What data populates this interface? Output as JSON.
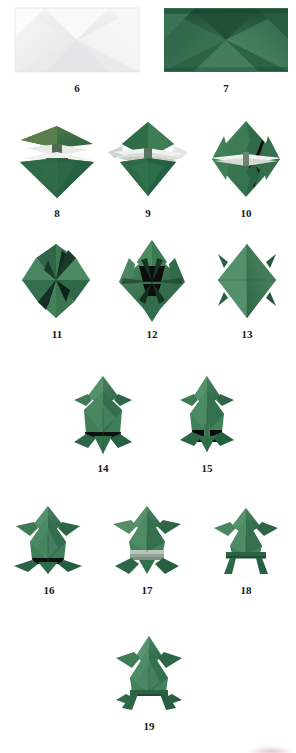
{
  "page": {
    "type": "origami-instruction-photo-sequence",
    "background_color": "#ffffff",
    "paper_colors": {
      "white_side": "#f3f4f4",
      "green_light": "#6ba678",
      "green_mid": "#3f8a5c",
      "green_dark": "#2c6443",
      "green_deep": "#1d4430",
      "shadow_black": "#0b0f0c",
      "highlight_white": "#eef0ec"
    },
    "caption_color": "#181818"
  },
  "steps": [
    {
      "number": "6",
      "name": "step-6-white-side-square-base-preliminary",
      "description": "white side of paper, rectangle with diagonal creases forming X pattern",
      "color": "white",
      "x": 14,
      "y": 6,
      "w": 126,
      "h": 68,
      "caption_x": 57,
      "caption_y": 82
    },
    {
      "number": "7",
      "name": "step-7-green-side-creased-rectangle",
      "description": "green side of paper, rectangle with diagonal creases forming X pattern",
      "color": "green",
      "x": 163,
      "y": 6,
      "w": 126,
      "h": 68,
      "caption_x": 206,
      "caption_y": 82
    },
    {
      "number": "8",
      "name": "step-8-partial-collapse-diamond",
      "description": "diamond shape with upper flaps splayed showing white interior",
      "color": "green",
      "x": 16,
      "y": 118,
      "w": 82,
      "h": 82,
      "caption_x": 37,
      "caption_y": 207
    },
    {
      "number": "9",
      "name": "step-9-collapsed-diamond-side-points",
      "description": "diamond with horizontal white side points extended left and right",
      "color": "green",
      "x": 106,
      "y": 118,
      "w": 84,
      "h": 82,
      "caption_x": 128,
      "caption_y": 207
    },
    {
      "number": "10",
      "name": "step-10-diamond-with-open-flaps",
      "description": "diamond with open vertical flaps revealing dark interior",
      "color": "green",
      "x": 206,
      "y": 118,
      "w": 80,
      "h": 82,
      "caption_x": 226,
      "caption_y": 207
    },
    {
      "number": "11",
      "name": "step-11-pinwheel-diamond",
      "description": "diamond with swirled pinwheel-like folds",
      "color": "green",
      "x": 18,
      "y": 240,
      "w": 76,
      "h": 82,
      "caption_x": 37,
      "caption_y": 328
    },
    {
      "number": "12",
      "name": "step-12-four-point-diamond",
      "description": "diamond with four raised points and dark center opening",
      "color": "green",
      "x": 113,
      "y": 238,
      "w": 78,
      "h": 86,
      "caption_x": 132,
      "caption_y": 328
    },
    {
      "number": "13",
      "name": "step-13-diamond-with-side-spikes",
      "description": "smooth diamond with small spikes at the four sides",
      "color": "green",
      "x": 214,
      "y": 240,
      "w": 66,
      "h": 82,
      "caption_x": 227,
      "caption_y": 328
    },
    {
      "number": "14",
      "name": "step-14-frog-body-front",
      "description": "frog body taking shape, front view with forelegs spread",
      "color": "green",
      "x": 72,
      "y": 374,
      "w": 62,
      "h": 82,
      "caption_x": 83,
      "caption_y": 462
    },
    {
      "number": "15",
      "name": "step-15-frog-body-narrow-legs",
      "description": "frog body with narrowed rear legs and dark shadow underneath",
      "color": "green",
      "x": 176,
      "y": 374,
      "w": 62,
      "h": 82,
      "caption_x": 187,
      "caption_y": 462
    },
    {
      "number": "16",
      "name": "step-16-frog-with-folded-hind-legs",
      "description": "frog with hind legs folded outward",
      "color": "green",
      "x": 10,
      "y": 502,
      "w": 76,
      "h": 76,
      "caption_x": 29,
      "caption_y": 584
    },
    {
      "number": "17",
      "name": "step-17-frog-with-pleated-legs",
      "description": "frog with pleated band across lower body and splayed legs",
      "color": "green",
      "x": 109,
      "y": 502,
      "w": 76,
      "h": 76,
      "caption_x": 127,
      "caption_y": 584
    },
    {
      "number": "18",
      "name": "step-18-frog-with-straight-legs",
      "description": "frog with straight horizontal bar legs",
      "color": "green",
      "x": 208,
      "y": 502,
      "w": 76,
      "h": 76,
      "caption_x": 226,
      "caption_y": 584
    },
    {
      "number": "19",
      "name": "step-19-finished-jumping-frog",
      "description": "completed origami frog standing on four legs",
      "color": "green",
      "x": 108,
      "y": 630,
      "w": 82,
      "h": 84,
      "caption_x": 129,
      "caption_y": 720
    }
  ]
}
